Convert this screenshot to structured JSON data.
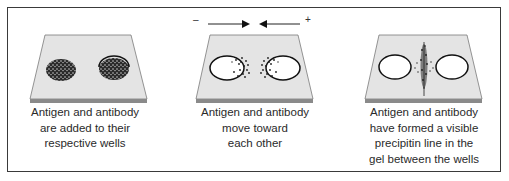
{
  "figure": {
    "panels": [
      {
        "id": "step-1",
        "caption_lines": [
          "Antigen and antibody",
          "are added to their",
          "respective wells"
        ],
        "state": "wells-filled"
      },
      {
        "id": "step-2",
        "caption_lines": [
          "Antigen and antibody",
          "move toward",
          "each other"
        ],
        "state": "diffusing",
        "arrows": {
          "left_sign": "–",
          "right_sign": "+"
        }
      },
      {
        "id": "step-3",
        "caption_lines": [
          "Antigen and antibody",
          "have formed a visible",
          "precipitin line in the",
          "gel between the wells"
        ],
        "state": "precipitin-line"
      }
    ],
    "colors": {
      "gel": "#e4e4e4",
      "gel_edge": "#8a8a8a",
      "frame": "#3a3a3a",
      "dots": "#1e1e1e"
    }
  }
}
